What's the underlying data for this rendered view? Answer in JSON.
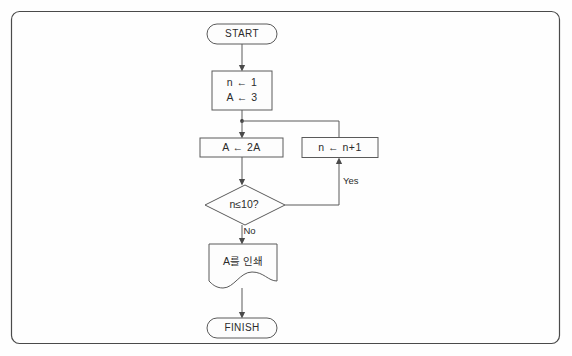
{
  "diagram": {
    "background_color": "#fefefe",
    "frame": {
      "stroke_color": "#4a4a4a",
      "corner_radius": 8
    },
    "shape_stroke_color": "#5a5a5a",
    "shape_fill_color": "#fdfdfd",
    "text_color": "#2b2b2b",
    "nodes": {
      "start": {
        "label": "START",
        "shape": "terminator"
      },
      "init": {
        "line1": "n ← 1",
        "line2": "A ← 3",
        "shape": "process"
      },
      "double": {
        "label": "A ← 2A",
        "shape": "process"
      },
      "increment": {
        "label": "n ← n+1",
        "shape": "process"
      },
      "decision": {
        "label": "n≤10?",
        "shape": "decision"
      },
      "print": {
        "label": "A를 인쇄",
        "shape": "document"
      },
      "finish": {
        "label": "FINISH",
        "shape": "terminator"
      }
    },
    "edge_labels": {
      "yes": "Yes",
      "no": "No"
    }
  }
}
